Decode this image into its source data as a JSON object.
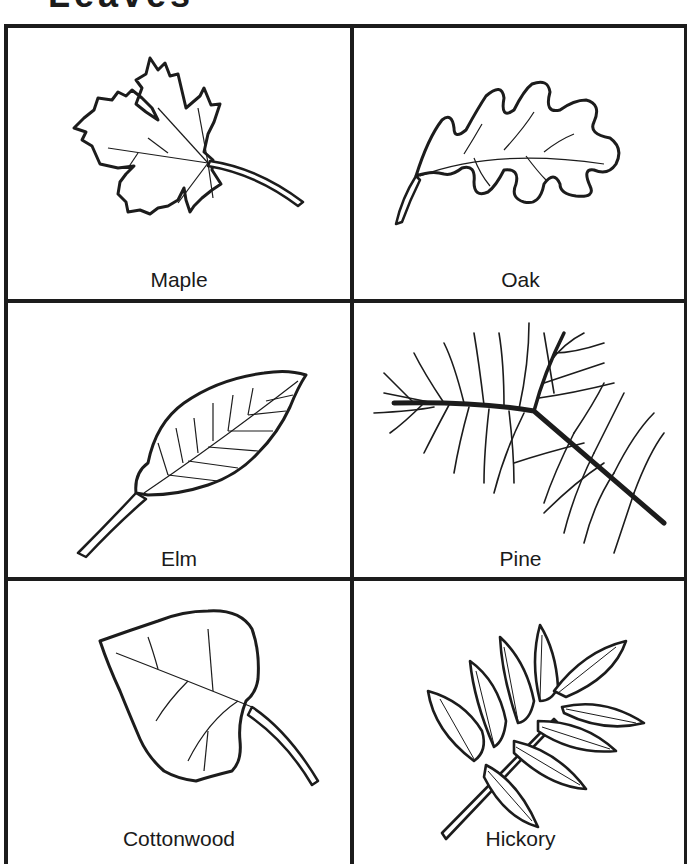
{
  "page": {
    "title_partial": "Leaves",
    "line_color": "#1c1c1c",
    "background": "#ffffff"
  },
  "leaves": [
    {
      "name": "Maple",
      "position": "row1-left",
      "icon": "maple-leaf-icon"
    },
    {
      "name": "Oak",
      "position": "row1-right",
      "icon": "oak-leaf-icon"
    },
    {
      "name": "Elm",
      "position": "row2-left",
      "icon": "elm-leaf-icon"
    },
    {
      "name": "Pine",
      "position": "row2-right",
      "icon": "pine-branch-icon"
    },
    {
      "name": "Cottonwood",
      "position": "row3-left",
      "icon": "cottonwood-leaf-icon"
    },
    {
      "name": "Hickory",
      "position": "row3-right",
      "icon": "hickory-leaf-icon"
    }
  ]
}
